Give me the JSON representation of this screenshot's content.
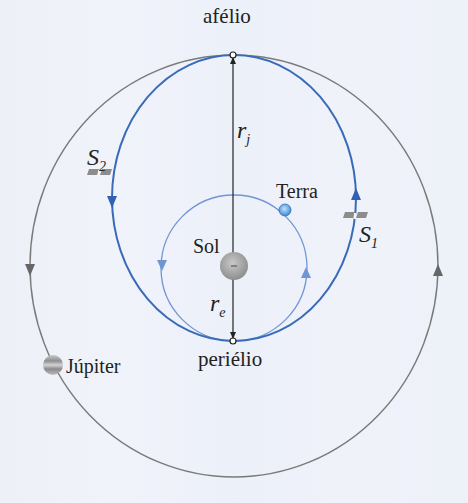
{
  "diagram": {
    "labels": {
      "aphelion": "afélio",
      "perihelion": "periélio",
      "sun": "Sol",
      "earth": "Terra",
      "jupiter": "Júpiter",
      "r_jupiter": {
        "main": "r",
        "sub": "j"
      },
      "r_earth": {
        "main": "r",
        "sub": "e"
      },
      "sat1": {
        "main": "S",
        "sub": "1"
      },
      "sat2": {
        "main": "S",
        "sub": "2"
      }
    },
    "colors": {
      "outer_orbit": "#7a7a7a",
      "transfer_orbit": "#3a6bb8",
      "earth_orbit": "#6f96d3",
      "sun": "#a9a9a9",
      "text": "#222222"
    },
    "geometry": {
      "jupiter_orbit": {
        "cx": 234,
        "cy": 266,
        "rx": 204,
        "ry": 211
      },
      "transfer_orbit": {
        "cx": 234,
        "cy": 198,
        "rx": 122,
        "ry": 143
      },
      "earth_orbit": {
        "cx": 234,
        "cy": 268,
        "r": 73
      },
      "sun": {
        "cx": 234,
        "cy": 266,
        "r": 13
      },
      "aphelion_point": {
        "x": 233,
        "y": 55
      },
      "perihelion_point": {
        "x": 233,
        "y": 341
      }
    }
  }
}
